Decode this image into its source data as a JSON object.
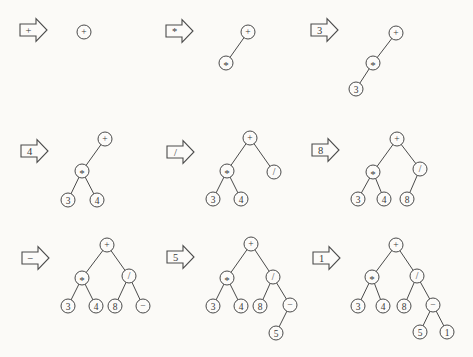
{
  "diagram": {
    "description_colors": {
      "background": "#fbfaf7",
      "stroke": "#4a4a4a",
      "node_fill": "#fcfbf9",
      "text": "#3a3a3a"
    },
    "node_radius": 7,
    "arrow_geometry": {
      "tail_w": 16,
      "head_w": 11,
      "tail_half_h": 6,
      "head_half_h": 11.5
    },
    "panels": [
      {
        "input": "+",
        "arrow": {
          "x": 20,
          "y": 30
        },
        "nodes": [
          {
            "label": "+",
            "x": 84,
            "y": 32
          }
        ],
        "edges": []
      },
      {
        "input": "*",
        "arrow": {
          "x": 166,
          "y": 31
        },
        "nodes": [
          {
            "label": "+",
            "x": 248,
            "y": 32
          },
          {
            "label": "*",
            "x": 226,
            "y": 63
          }
        ],
        "edges": [
          [
            0,
            1
          ]
        ]
      },
      {
        "input": "3",
        "arrow": {
          "x": 311,
          "y": 30
        },
        "nodes": [
          {
            "label": "+",
            "x": 396,
            "y": 33
          },
          {
            "label": "*",
            "x": 373,
            "y": 63
          },
          {
            "label": "3",
            "x": 356,
            "y": 89
          }
        ],
        "edges": [
          [
            0,
            1
          ],
          [
            1,
            2
          ]
        ]
      },
      {
        "input": "4",
        "arrow": {
          "x": 21,
          "y": 151
        },
        "nodes": [
          {
            "label": "+",
            "x": 105,
            "y": 139
          },
          {
            "label": "*",
            "x": 82,
            "y": 171
          },
          {
            "label": "3",
            "x": 68,
            "y": 200
          },
          {
            "label": "4",
            "x": 97,
            "y": 200
          }
        ],
        "edges": [
          [
            0,
            1
          ],
          [
            1,
            2
          ],
          [
            1,
            3
          ]
        ]
      },
      {
        "input": "/",
        "arrow": {
          "x": 167,
          "y": 152
        },
        "nodes": [
          {
            "label": "+",
            "x": 250,
            "y": 138
          },
          {
            "label": "*",
            "x": 227,
            "y": 171
          },
          {
            "label": "/",
            "x": 274,
            "y": 172
          },
          {
            "label": "3",
            "x": 213,
            "y": 199
          },
          {
            "label": "4",
            "x": 241,
            "y": 199
          }
        ],
        "edges": [
          [
            0,
            1
          ],
          [
            0,
            2
          ],
          [
            1,
            3
          ],
          [
            1,
            4
          ]
        ]
      },
      {
        "input": "8",
        "arrow": {
          "x": 312,
          "y": 150
        },
        "nodes": [
          {
            "label": "+",
            "x": 397,
            "y": 139
          },
          {
            "label": "*",
            "x": 373,
            "y": 172
          },
          {
            "label": "/",
            "x": 420,
            "y": 169
          },
          {
            "label": "3",
            "x": 358,
            "y": 199
          },
          {
            "label": "4",
            "x": 384,
            "y": 199
          },
          {
            "label": "8",
            "x": 407,
            "y": 199
          }
        ],
        "edges": [
          [
            0,
            1
          ],
          [
            0,
            2
          ],
          [
            1,
            3
          ],
          [
            1,
            4
          ],
          [
            2,
            5
          ]
        ]
      },
      {
        "input": "−",
        "arrow": {
          "x": 22,
          "y": 258
        },
        "nodes": [
          {
            "label": "+",
            "x": 107,
            "y": 245
          },
          {
            "label": "*",
            "x": 82,
            "y": 278
          },
          {
            "label": "/",
            "x": 129,
            "y": 276
          },
          {
            "label": "3",
            "x": 68,
            "y": 306
          },
          {
            "label": "4",
            "x": 96,
            "y": 306
          },
          {
            "label": "8",
            "x": 115,
            "y": 306
          },
          {
            "label": "−",
            "x": 143,
            "y": 306
          }
        ],
        "edges": [
          [
            0,
            1
          ],
          [
            0,
            2
          ],
          [
            1,
            3
          ],
          [
            1,
            4
          ],
          [
            2,
            5
          ],
          [
            2,
            6
          ]
        ]
      },
      {
        "input": "5",
        "arrow": {
          "x": 167,
          "y": 257
        },
        "nodes": [
          {
            "label": "+",
            "x": 251,
            "y": 244
          },
          {
            "label": "*",
            "x": 227,
            "y": 278
          },
          {
            "label": "/",
            "x": 273,
            "y": 277
          },
          {
            "label": "3",
            "x": 213,
            "y": 306
          },
          {
            "label": "4",
            "x": 241,
            "y": 306
          },
          {
            "label": "8",
            "x": 260,
            "y": 306
          },
          {
            "label": "−",
            "x": 290,
            "y": 305
          },
          {
            "label": "5",
            "x": 276,
            "y": 333
          }
        ],
        "edges": [
          [
            0,
            1
          ],
          [
            0,
            2
          ],
          [
            1,
            3
          ],
          [
            1,
            4
          ],
          [
            2,
            5
          ],
          [
            2,
            6
          ],
          [
            6,
            7
          ]
        ]
      },
      {
        "input": "1",
        "arrow": {
          "x": 313,
          "y": 258
        },
        "nodes": [
          {
            "label": "+",
            "x": 396,
            "y": 245
          },
          {
            "label": "*",
            "x": 372,
            "y": 277
          },
          {
            "label": "/",
            "x": 417,
            "y": 276
          },
          {
            "label": "3",
            "x": 358,
            "y": 306
          },
          {
            "label": "4",
            "x": 383,
            "y": 306
          },
          {
            "label": "8",
            "x": 404,
            "y": 306
          },
          {
            "label": "−",
            "x": 433,
            "y": 305
          },
          {
            "label": "5",
            "x": 420,
            "y": 332
          },
          {
            "label": "1",
            "x": 447,
            "y": 332
          }
        ],
        "edges": [
          [
            0,
            1
          ],
          [
            0,
            2
          ],
          [
            1,
            3
          ],
          [
            1,
            4
          ],
          [
            2,
            5
          ],
          [
            2,
            6
          ],
          [
            6,
            7
          ],
          [
            6,
            8
          ]
        ]
      }
    ]
  }
}
